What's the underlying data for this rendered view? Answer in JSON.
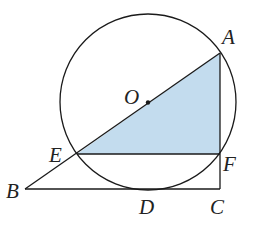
{
  "diagram": {
    "type": "geometry",
    "colors": {
      "stroke": "#1a1a1a",
      "fill_shaded": "#c3dcee",
      "background": "#ffffff"
    },
    "points": {
      "A": {
        "label": "A",
        "x": 220,
        "y": 53
      },
      "O": {
        "label": "O",
        "x": 148,
        "y": 103
      },
      "E": {
        "label": "E",
        "x": 77,
        "y": 154
      },
      "F": {
        "label": "F",
        "x": 220,
        "y": 154
      },
      "B": {
        "label": "B",
        "x": 25,
        "y": 189
      },
      "D": {
        "label": "D",
        "x": 150,
        "y": 189
      },
      "C": {
        "label": "C",
        "x": 220,
        "y": 189
      }
    },
    "circle": {
      "center": "O",
      "cx": 148,
      "cy": 102,
      "r": 88
    },
    "segments": [
      "AB",
      "AC",
      "BC",
      "EF"
    ],
    "shaded_region": "triangle AEF"
  }
}
